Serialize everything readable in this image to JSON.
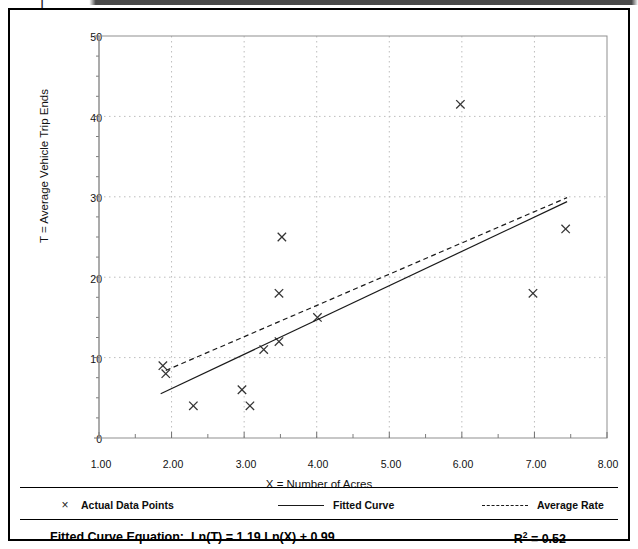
{
  "figure": {
    "artifact_glyph": "|",
    "ghost_text": ""
  },
  "axes": {
    "x_title": "X = Number of Acres",
    "y_title": "T = Average Vehicle Trip Ends",
    "x_ticks": [
      "1.00",
      "2.00",
      "3.00",
      "4.00",
      "5.00",
      "6.00",
      "7.00",
      "8.00"
    ],
    "y_ticks": [
      "0",
      "10",
      "20",
      "30",
      "40",
      "50"
    ]
  },
  "legend": {
    "items": [
      {
        "label": "Actual Data Points",
        "marker": "×",
        "style": "marker"
      },
      {
        "label": "Fitted Curve",
        "marker": "",
        "style": "solid"
      },
      {
        "label": "Average Rate",
        "marker": "",
        "style": "dashed"
      }
    ]
  },
  "equation": {
    "label": "Fitted Curve Equation:  Ln(T) = 1.19 Ln(X) + 0.99",
    "r2_prefix": "R",
    "r2_sup": "2",
    "r2_value": " = 0.52"
  },
  "chart_data": {
    "type": "scatter",
    "title": "",
    "xlabel": "X = Number of Acres",
    "ylabel": "T = Average Vehicle Trip Ends",
    "xlim": [
      1.0,
      8.0
    ],
    "ylim": [
      0,
      50
    ],
    "xticks": [
      1.0,
      2.0,
      3.0,
      4.0,
      5.0,
      6.0,
      7.0,
      8.0
    ],
    "yticks": [
      0,
      10,
      20,
      30,
      40,
      50
    ],
    "x_minor_step": 0.5,
    "y_minor_step": 2.5,
    "grid": "dotted-major-both",
    "legend_position": "below-plot",
    "series": [
      {
        "name": "Actual Data Points",
        "type": "scatter",
        "marker": "x",
        "color": "#333333",
        "points": [
          {
            "x": 1.88,
            "y": 9.0
          },
          {
            "x": 1.92,
            "y": 8.0
          },
          {
            "x": 2.3,
            "y": 4.0
          },
          {
            "x": 2.97,
            "y": 6.0
          },
          {
            "x": 3.08,
            "y": 4.0
          },
          {
            "x": 3.27,
            "y": 11.0
          },
          {
            "x": 3.48,
            "y": 12.0
          },
          {
            "x": 3.52,
            "y": 25.0
          },
          {
            "x": 3.48,
            "y": 18.0
          },
          {
            "x": 4.01,
            "y": 15.0
          },
          {
            "x": 5.98,
            "y": 41.5
          },
          {
            "x": 6.98,
            "y": 18.0
          },
          {
            "x": 7.43,
            "y": 26.0
          }
        ]
      },
      {
        "name": "Fitted Curve",
        "type": "line",
        "style": "solid",
        "color": "#1a1a1a",
        "equation": "Ln(T) = 1.19 Ln(X) + 0.99",
        "r_squared": 0.52,
        "points": [
          {
            "x": 1.85,
            "y": 5.5
          },
          {
            "x": 7.45,
            "y": 29.4
          }
        ]
      },
      {
        "name": "Average Rate",
        "type": "line",
        "style": "dashed",
        "color": "#1a1a1a",
        "points": [
          {
            "x": 1.92,
            "y": 8.4
          },
          {
            "x": 7.45,
            "y": 29.9
          }
        ]
      }
    ]
  }
}
